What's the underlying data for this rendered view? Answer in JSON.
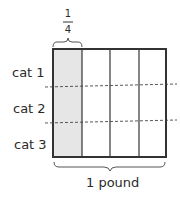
{
  "diagram": {
    "type": "fraction-area-model",
    "whole_label": "1 pound",
    "top_brace_fraction": {
      "numerator": "1",
      "denominator": "4"
    },
    "columns": 4,
    "shaded_columns": [
      0
    ],
    "rows": [
      {
        "label": "cat 1"
      },
      {
        "label": "cat 2"
      },
      {
        "label": "cat 3"
      }
    ],
    "colors": {
      "shade": "#e6e6e6",
      "line": "#333333",
      "dash": "#444444"
    }
  }
}
